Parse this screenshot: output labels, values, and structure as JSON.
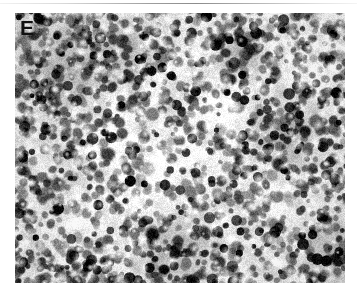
{
  "figure": {
    "panel_letter": "E",
    "panel_type": "histopathology-micrograph",
    "staining": "grayscale",
    "background_color": "#ffffff",
    "top_rule_color": "#9e9e9e",
    "label_color": "#111111"
  },
  "micrograph": {
    "x": 15,
    "y": 13,
    "width": 330,
    "height": 270,
    "base_tone": "#9d9d9d",
    "light_tone": "#f4f4f4",
    "mid_tone": "#9a9a9a",
    "dark_tone": "#1c1c1c",
    "nuclei_count": 1450,
    "nucleus_radius_min": 3.0,
    "nucleus_radius_max": 7.2,
    "pale_zones": [
      {
        "cx": 150,
        "cy": 150,
        "r": 62
      },
      {
        "cx": 96,
        "cy": 118,
        "r": 44
      },
      {
        "cx": 210,
        "cy": 96,
        "r": 38
      },
      {
        "cx": 262,
        "cy": 196,
        "r": 40
      },
      {
        "cx": 60,
        "cy": 208,
        "r": 34
      },
      {
        "cx": 292,
        "cy": 62,
        "r": 30
      }
    ],
    "dark_zones": [
      {
        "cx": 52,
        "cy": 60,
        "r": 54
      },
      {
        "cx": 268,
        "cy": 120,
        "r": 50
      },
      {
        "cx": 160,
        "cy": 238,
        "r": 52
      },
      {
        "cx": 112,
        "cy": 40,
        "r": 38
      },
      {
        "cx": 318,
        "cy": 240,
        "r": 40
      },
      {
        "cx": 226,
        "cy": 40,
        "r": 32
      }
    ]
  }
}
